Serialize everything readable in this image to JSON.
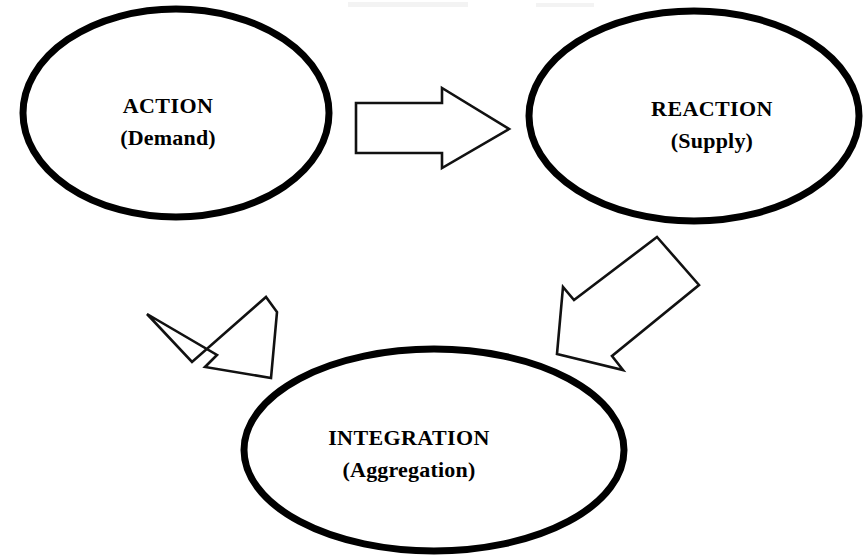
{
  "diagram": {
    "background_color": "#ffffff",
    "stroke_color": "#000000",
    "fill_color": "#ffffff",
    "nodes": [
      {
        "id": "action",
        "shape": "ellipse",
        "primary_label": "ACTION",
        "secondary_label": "(Demand)",
        "cx": 176,
        "cy": 113,
        "rx": 153,
        "ry": 104,
        "text_cx": 168,
        "text_baseline_primary": 113,
        "text_baseline_secondary": 145
      },
      {
        "id": "reaction",
        "shape": "ellipse",
        "primary_label": "REACTION",
        "secondary_label": "(Supply)",
        "cx": 694,
        "cy": 116,
        "rx": 165,
        "ry": 105,
        "text_cx": 712,
        "text_baseline_primary": 116,
        "text_baseline_secondary": 148
      },
      {
        "id": "integration",
        "shape": "ellipse",
        "primary_label": "INTEGRATION",
        "secondary_label": "(Aggregation)",
        "cx": 434,
        "cy": 450,
        "rx": 190,
        "ry": 101,
        "text_cx": 409,
        "text_baseline_primary": 445,
        "text_baseline_secondary": 477
      }
    ],
    "arrows": [
      {
        "id": "action-to-reaction",
        "from": "action",
        "to": "reaction",
        "direction": "right",
        "style": "hollow-block-arrow"
      },
      {
        "id": "reaction-to-integration",
        "from": "reaction",
        "to": "integration",
        "direction": "down-left",
        "style": "hollow-block-arrow"
      },
      {
        "id": "integration-to-action",
        "from": "integration",
        "to": "action",
        "direction": "up-left",
        "style": "hollow-block-arrow"
      }
    ]
  }
}
